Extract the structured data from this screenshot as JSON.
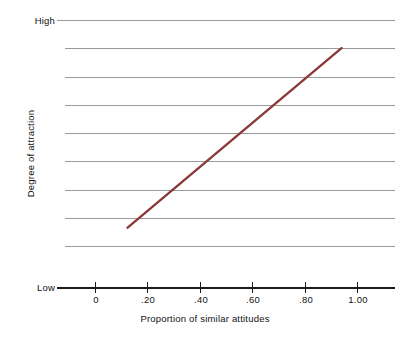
{
  "chart_data": {
    "type": "line",
    "title": "",
    "xlabel": "Proportion of similar attitudes",
    "ylabel": "Degree of attraction",
    "x": [
      0.125,
      0.945
    ],
    "values": [
      0.225,
      0.895
    ],
    "series": [
      {
        "name": "attraction",
        "x": [
          0.125,
          0.945
        ],
        "values": [
          0.225,
          0.895
        ],
        "color": "#8B3A3A"
      }
    ],
    "xlim": [
      -0.115,
      1.15
    ],
    "ylim": [
      0,
      1
    ],
    "xticks": [
      0,
      0.2,
      0.4,
      0.6,
      0.8,
      1.0
    ],
    "xticklabels": [
      "0",
      ".20",
      ".40",
      ".60",
      ".80",
      "1.00"
    ],
    "ytick_endpoint_labels": {
      "top": "High",
      "bottom": "Low"
    },
    "grid": true,
    "grid_lines": 9,
    "legend": "none",
    "annotations": []
  },
  "axes": {
    "y_high_label": "High",
    "y_low_label": "Low",
    "y_title": "Degree of attraction",
    "x_title": "Proportion of similar attitudes",
    "x_tick_labels": [
      "0",
      ".20",
      ".40",
      ".60",
      ".80",
      "1.00"
    ]
  },
  "colors": {
    "line": "#8B3A3A",
    "grid": "#9a9a9a",
    "axis": "#1a1a1a",
    "text": "#111111",
    "background": "#ffffff"
  }
}
